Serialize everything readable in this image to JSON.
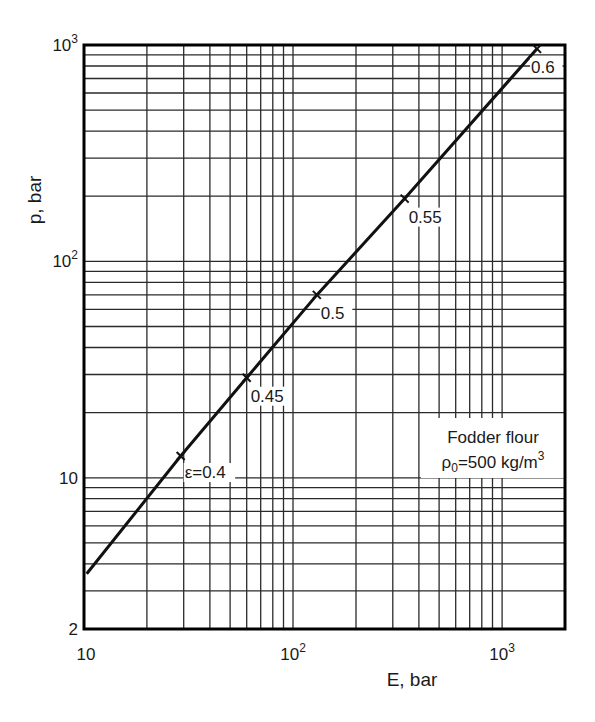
{
  "chart_data": {
    "type": "line",
    "title": "",
    "xlabel": "E, bar",
    "ylabel": "p, bar",
    "xscale": "log",
    "yscale": "log",
    "xlim": [
      10,
      2000
    ],
    "ylim": [
      2,
      1000
    ],
    "grid": true,
    "x_ticks": [
      {
        "value": 10,
        "label": "10",
        "base": "10",
        "exp": ""
      },
      {
        "value": 100,
        "label": "10^2",
        "base": "10",
        "exp": "2"
      },
      {
        "value": 1000,
        "label": "10^3",
        "base": "10",
        "exp": "3"
      }
    ],
    "y_ticks": [
      {
        "value": 2,
        "label": "2",
        "base": "2",
        "exp": ""
      },
      {
        "value": 10,
        "label": "10",
        "base": "10",
        "exp": ""
      },
      {
        "value": 100,
        "label": "10^2",
        "base": "10",
        "exp": "2"
      },
      {
        "value": 1000,
        "label": "10^3",
        "base": "10",
        "exp": "3"
      }
    ],
    "series": [
      {
        "name": "Fodder flour, rho0=500 kg/m3",
        "x": [
          10.3,
          29,
          60,
          130,
          342,
          1470
        ],
        "y": [
          3.6,
          12.6,
          29,
          70,
          195,
          960
        ]
      }
    ],
    "markers": [
      {
        "label": "ε=0.4",
        "epsilon": 0.4,
        "E": 29,
        "p": 12.6,
        "dx": 4,
        "dy": 22
      },
      {
        "label": "0.45",
        "epsilon": 0.45,
        "E": 60,
        "p": 29,
        "dx": 4,
        "dy": 24
      },
      {
        "label": "0.5",
        "epsilon": 0.5,
        "E": 130,
        "p": 70,
        "dx": 4,
        "dy": 24
      },
      {
        "label": "0.55",
        "epsilon": 0.55,
        "E": 342,
        "p": 195,
        "dx": 4,
        "dy": 24
      },
      {
        "label": "0.6",
        "epsilon": 0.6,
        "E": 1470,
        "p": 960,
        "dx": -6,
        "dy": 24
      }
    ],
    "annotation": {
      "line1": "Fodder flour",
      "line2_prefix": "ρ",
      "line2_sub": "0",
      "line2_main": "=500 kg/m",
      "line2_sup": "3"
    }
  },
  "layout": {
    "plot": {
      "left": 84,
      "right": 565,
      "top": 45,
      "bottom": 629
    },
    "colors": {
      "line": "#111111",
      "grid": "#2a2a2a",
      "frame": "#000000",
      "background": "#ffffff"
    }
  }
}
